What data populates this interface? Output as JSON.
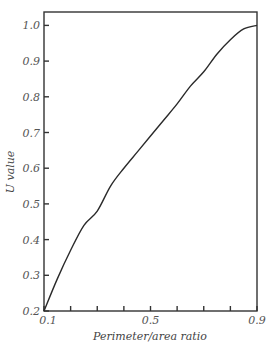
{
  "chart_data": {
    "type": "line",
    "title": "",
    "xlabel": "Perimeter/area ratio",
    "ylabel": "U value",
    "xlim": [
      0.1,
      0.9
    ],
    "ylim": [
      0.2,
      1.04
    ],
    "x_tick_labels": [
      "0.1",
      "0.5",
      "0.9"
    ],
    "x_minor_ticks": [
      0.2,
      0.3,
      0.4,
      0.6,
      0.7,
      0.8
    ],
    "y_ticks": [
      0.2,
      0.3,
      0.4,
      0.5,
      0.6,
      0.7,
      0.8,
      0.9,
      1.0
    ],
    "y_tick_labels": [
      "0.2",
      "0.3",
      "0.4",
      "0.5",
      "0.6",
      "0.7",
      "0.8",
      "0.9",
      "1.0"
    ],
    "grid": false,
    "legend": "none",
    "series": [
      {
        "name": "U value",
        "x": [
          0.1,
          0.15,
          0.2,
          0.25,
          0.3,
          0.35,
          0.4,
          0.45,
          0.5,
          0.55,
          0.6,
          0.65,
          0.7,
          0.75,
          0.8,
          0.85,
          0.9
        ],
        "y": [
          0.2,
          0.29,
          0.37,
          0.44,
          0.48,
          0.55,
          0.6,
          0.645,
          0.69,
          0.735,
          0.78,
          0.83,
          0.87,
          0.92,
          0.96,
          0.99,
          1.0
        ]
      }
    ]
  }
}
